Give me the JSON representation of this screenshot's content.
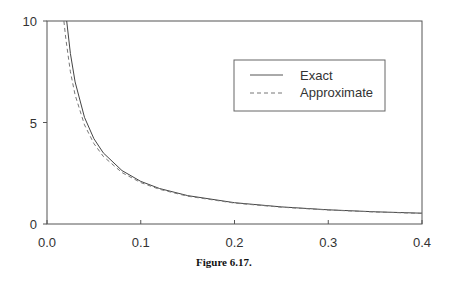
{
  "chart_data": {
    "type": "line",
    "title": "",
    "caption": "Figure 6.17.",
    "xlabel": "",
    "ylabel": "",
    "xlim": [
      0.0,
      0.4
    ],
    "ylim": [
      0,
      10
    ],
    "x_ticks": [
      "0.0",
      "0.1",
      "0.2",
      "0.3",
      "0.4"
    ],
    "y_ticks": [
      "0",
      "5",
      "10"
    ],
    "grid": false,
    "frame": "box",
    "legend": {
      "position": "upper right (inside)",
      "entries": [
        "Exact",
        "Approximate"
      ]
    },
    "series": [
      {
        "name": "Exact",
        "style": "solid",
        "x": [
          0.021,
          0.025,
          0.03,
          0.04,
          0.05,
          0.06,
          0.08,
          0.1,
          0.12,
          0.15,
          0.2,
          0.25,
          0.3,
          0.35,
          0.4
        ],
        "values": [
          10.0,
          8.4,
          7.0,
          5.25,
          4.2,
          3.5,
          2.63,
          2.1,
          1.75,
          1.4,
          1.05,
          0.84,
          0.7,
          0.6,
          0.53
        ]
      },
      {
        "name": "Approximate",
        "style": "dashed",
        "x": [
          0.018,
          0.02,
          0.025,
          0.03,
          0.04,
          0.05,
          0.06,
          0.08,
          0.1,
          0.12,
          0.15,
          0.2,
          0.25,
          0.3,
          0.35,
          0.4
        ],
        "values": [
          10.0,
          9.13,
          7.5,
          6.36,
          4.88,
          3.96,
          3.33,
          2.53,
          2.04,
          1.71,
          1.37,
          1.03,
          0.83,
          0.69,
          0.59,
          0.52
        ]
      }
    ]
  },
  "figure": {
    "caption": "Figure 6.17."
  }
}
